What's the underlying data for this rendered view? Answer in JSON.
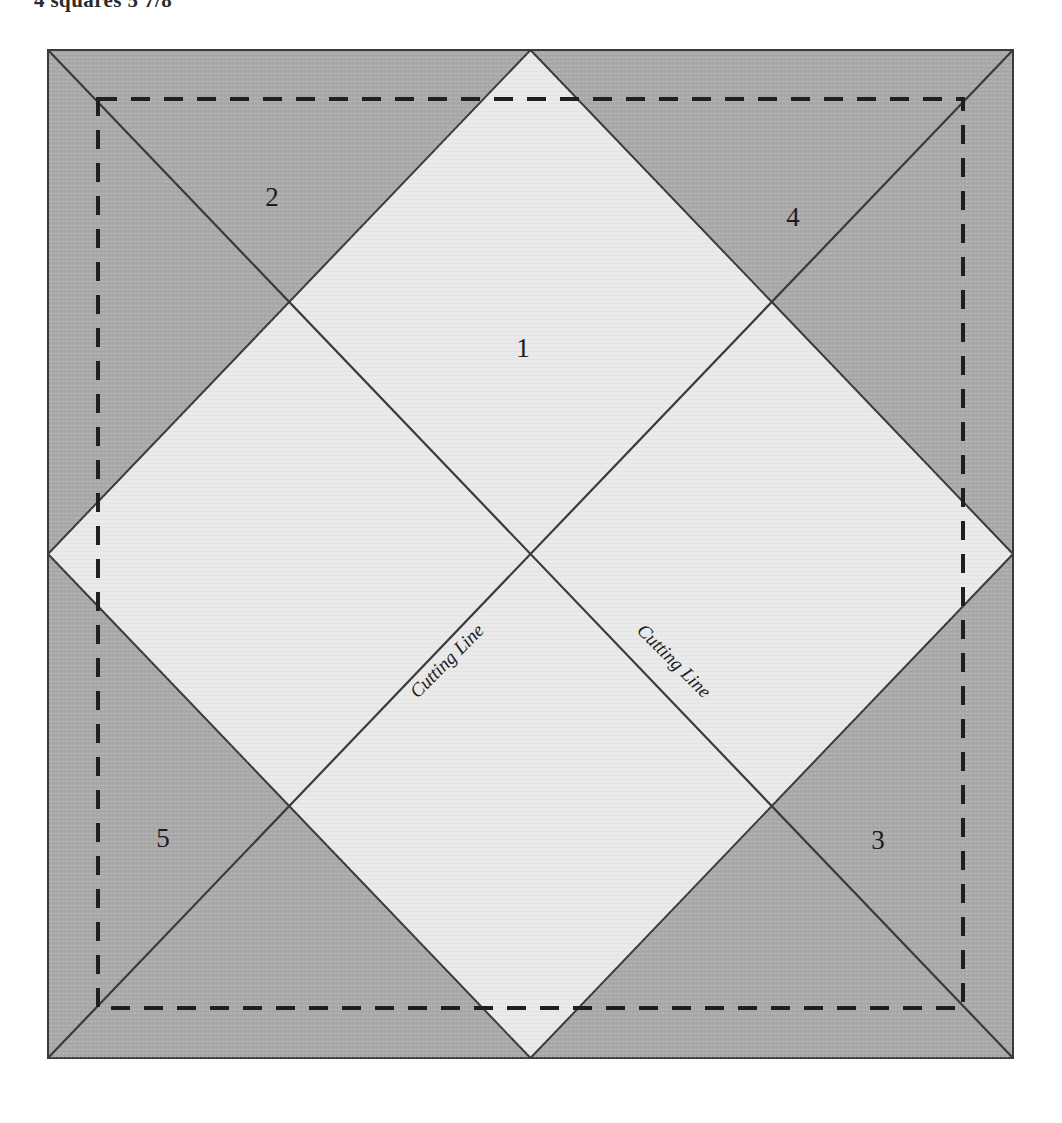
{
  "caption": {
    "text": "4 squares 5 7/8"
  },
  "figure": {
    "name": "quilting-block-cutting-diagram",
    "outer_square": {
      "fill_color": "#a9a9a9",
      "border_color": "#3a3a3a"
    },
    "inner_diamond": {
      "fill_color": "#e9e9e9",
      "border_color": "#3a3a3a"
    },
    "seam_allowance_dashed_line": {
      "color": "#1f1f1f",
      "inset_px": 50,
      "style": "dashed"
    },
    "diagonals": {
      "color": "#3a3a3a",
      "style": "solid"
    },
    "piece_labels": [
      {
        "id": "1",
        "text": "1",
        "x": 476,
        "y": 299,
        "region": "center-diamond"
      },
      {
        "id": "2",
        "text": "2",
        "x": 225,
        "y": 148,
        "region": "top-left-triangle"
      },
      {
        "id": "4",
        "text": "4",
        "x": 746,
        "y": 168,
        "region": "top-right-triangle"
      },
      {
        "id": "5",
        "text": "5",
        "x": 116,
        "y": 789,
        "region": "bottom-left-triangle"
      },
      {
        "id": "3",
        "text": "3",
        "x": 831,
        "y": 791,
        "region": "bottom-right-triangle"
      }
    ],
    "cutting_lines": [
      {
        "id": "left",
        "text": "Cutting Line",
        "rotation_deg": -45
      },
      {
        "id": "right",
        "text": "Cutting Line",
        "rotation_deg": 45
      }
    ]
  }
}
